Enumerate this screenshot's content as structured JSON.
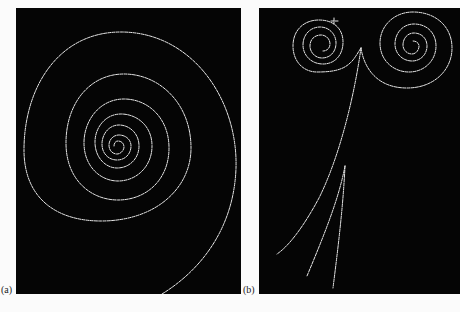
{
  "figure": {
    "panels": [
      {
        "id": "a",
        "label": "(a)",
        "description": "single inward spiral track"
      },
      {
        "id": "b",
        "label": "(b)",
        "description": "pair of opposite spirals from a common vertex with straight tracks"
      }
    ]
  },
  "colors": {
    "background": "#050505",
    "track": "#e8e8e8",
    "page": "#fbfbfb"
  }
}
